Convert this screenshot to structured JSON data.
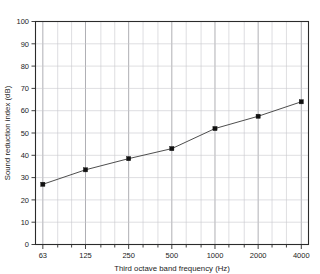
{
  "chart_data": {
    "type": "line",
    "title": "",
    "subtitle": "",
    "xlabel": "Third octave band frequency (Hz)",
    "ylabel": "Sound reduction index (dB)",
    "xscale": "log",
    "yscale": "linear",
    "xlim": [
      56,
      4490
    ],
    "ylim": [
      0,
      100
    ],
    "grid": true,
    "legend": "none",
    "marker": "square",
    "x": [
      63,
      125,
      250,
      500,
      1000,
      2000,
      4000
    ],
    "values": [
      27,
      33.5,
      38.5,
      43,
      52,
      57.5,
      64
    ],
    "categories": [
      "63",
      "125",
      "250",
      "500",
      "1000",
      "2000",
      "4000"
    ],
    "series": [
      {
        "name": "Sound reduction index",
        "values": [
          27,
          33.5,
          38.5,
          43,
          52,
          57.5,
          64
        ]
      }
    ],
    "x_tick_labels": [
      "63",
      "125",
      "250",
      "500",
      "1000",
      "2000",
      "4000"
    ],
    "y_tick_labels": [
      "0",
      "10",
      "20",
      "30",
      "40",
      "50",
      "60",
      "70",
      "80",
      "90",
      "100"
    ],
    "y_ticks": [
      0,
      10,
      20,
      30,
      40,
      50,
      60,
      70,
      80,
      90,
      100
    ],
    "x_minor_ticks": [
      80,
      100,
      160,
      200,
      315,
      400,
      630,
      800,
      1250,
      1600,
      2500,
      3150
    ],
    "annotations": [],
    "colors": {
      "line": "#3a3a3a",
      "marker": "#111111",
      "grid_minor": "#c8c8cc",
      "grid_major": "#8d8d93",
      "frame": "#2b2b2b",
      "background": "#ffffff"
    }
  }
}
